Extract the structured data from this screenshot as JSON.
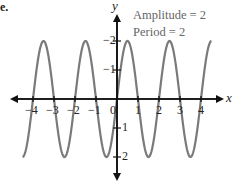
{
  "part_label": "e.",
  "annotations": {
    "amplitude": "Amplitude = 2",
    "period": "Period = 2"
  },
  "axes": {
    "x_label": "x",
    "y_label": "y",
    "x_ticks": [
      "−4",
      "−3",
      "−2",
      "−1",
      "0",
      "1",
      "2",
      "3",
      "4"
    ],
    "y_ticks": [
      "2",
      "1",
      "−1",
      "−2"
    ]
  },
  "colors": {
    "curve": "#7a7a7a",
    "axes": "#111111",
    "annotation": "#666666"
  },
  "chart_data": {
    "type": "line",
    "title": "",
    "function": "y = 2 sin(πx)",
    "xlabel": "x",
    "ylabel": "y",
    "xlim": [
      -4.5,
      4.5
    ],
    "ylim": [
      -2.5,
      2.5
    ],
    "grid": false,
    "legend": "none",
    "annotations": [
      "Amplitude = 2",
      "Period = 2"
    ],
    "x_ticks": [
      -4,
      -3,
      -2,
      -1,
      0,
      1,
      2,
      3,
      4
    ],
    "y_ticks": [
      -2,
      -1,
      1,
      2
    ],
    "series": [
      {
        "name": "y = 2 sin(πx)",
        "x": [
          -4,
          -3.5,
          -3,
          -2.5,
          -2,
          -1.5,
          -1,
          -0.5,
          0,
          0.5,
          1,
          1.5,
          2,
          2.5,
          3,
          3.5,
          4
        ],
        "values": [
          0,
          2,
          0,
          -2,
          0,
          2,
          0,
          -2,
          0,
          2,
          0,
          -2,
          0,
          2,
          0,
          -2,
          0
        ]
      }
    ]
  }
}
